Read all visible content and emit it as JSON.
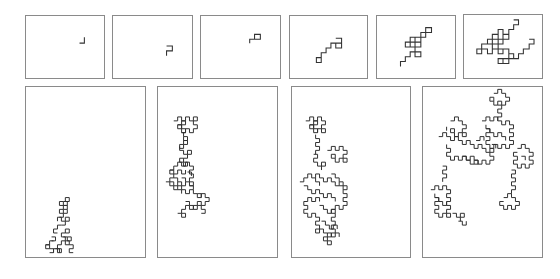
{
  "figure": {
    "top_row": [
      {
        "id": "t1",
        "stage": 1
      },
      {
        "id": "t2",
        "stage": 2
      },
      {
        "id": "t3",
        "stage": 3
      },
      {
        "id": "t4",
        "stage": 4
      },
      {
        "id": "t5",
        "stage": 5
      },
      {
        "id": "t6",
        "stage": 6
      }
    ],
    "bottom_row": [
      {
        "id": "b1",
        "stage": 7
      },
      {
        "id": "b2",
        "stage": 8
      },
      {
        "id": "b3",
        "stage": 9
      },
      {
        "id": "b4",
        "stage": 10
      }
    ],
    "colors": {
      "frame": "#8a8a8a",
      "stroke": "#333333",
      "background": "#ffffff"
    }
  }
}
